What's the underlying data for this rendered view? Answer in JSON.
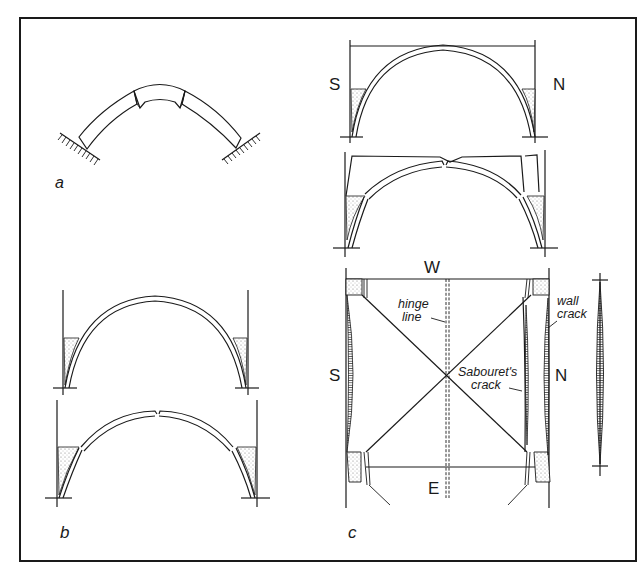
{
  "figure": {
    "panels": [
      {
        "id": "a",
        "label": "a",
        "description": "Hinged arch with cracks at crown and haunches, fixed supports"
      },
      {
        "id": "b",
        "label": "b",
        "description": "Semicircular arch section before and after deformation, showing crown and haunch cracks with fill"
      },
      {
        "id": "c",
        "label": "c",
        "description": "Barrel vault sections and plan view with hinge line, Sabouret's crack and wall crack"
      }
    ],
    "panel_c": {
      "compass": {
        "south": "S",
        "north": "N",
        "west": "W",
        "east": "E"
      },
      "annotations": {
        "hinge_line": [
          "hinge",
          "line"
        ],
        "sabouret": [
          "Sabouret's",
          "crack"
        ],
        "wall_crack": [
          "wall",
          "crack"
        ]
      }
    },
    "colors": {
      "ink": "#1a1a1a",
      "background": "#ffffff",
      "stipple": "#9a9a9a"
    }
  }
}
